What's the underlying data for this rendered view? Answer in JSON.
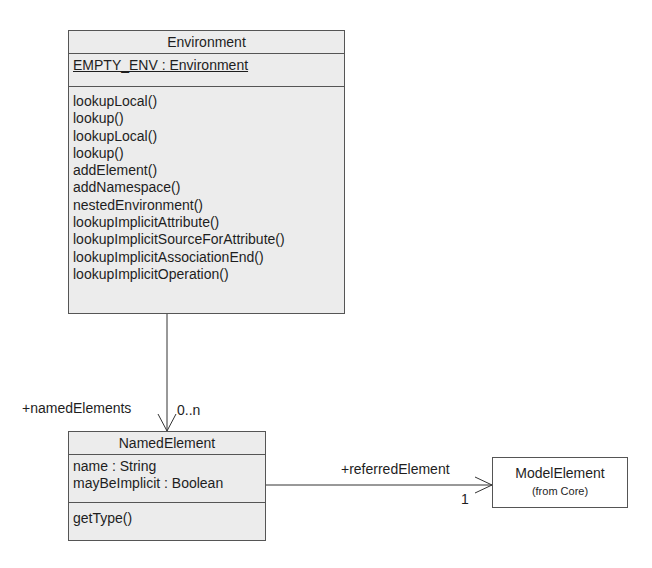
{
  "classes": {
    "environment": {
      "name": "Environment",
      "attributes": [
        {
          "text": "EMPTY_ENV : Environment",
          "static": true
        }
      ],
      "operations": [
        "lookupLocal()",
        "lookup()",
        "lookupLocal()",
        "lookup()",
        "addElement()",
        "addNamespace()",
        "nestedEnvironment()",
        "lookupImplicitAttribute()",
        "lookupImplicitSourceForAttribute()",
        "lookupImplicitAssociationEnd()",
        "lookupImplicitOperation()"
      ]
    },
    "named_element": {
      "name": "NamedElement",
      "attributes": [
        {
          "text": "name : String"
        },
        {
          "text": "mayBeImplicit : Boolean"
        }
      ],
      "operations": [
        "getType()"
      ]
    },
    "model_element": {
      "name": "ModelElement",
      "package_note": "(from Core)"
    }
  },
  "associations": [
    {
      "from": "Environment",
      "to": "NamedElement",
      "role": "+namedElements",
      "multiplicity": "0..n"
    },
    {
      "from": "NamedElement",
      "to": "ModelElement",
      "role": "+referredElement",
      "multiplicity": "1"
    }
  ],
  "colors": {
    "class_fill": "#ececec",
    "border": "#555555",
    "text": "#1e1e1e"
  }
}
